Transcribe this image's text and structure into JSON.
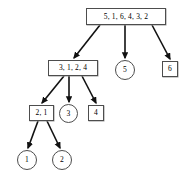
{
  "diagram": {
    "type": "recursion-tree",
    "width": 194,
    "height": 175,
    "stroke_color": "#4d4d4d",
    "edge_color": "#111111",
    "background": "#ffffff",
    "nodes": [
      {
        "id": "root",
        "label": "5, 1, 6, 4, 3, 2",
        "shape": "box",
        "x": 86,
        "y": 8,
        "w": 80,
        "h": 17,
        "font_size": 7.5
      },
      {
        "id": "n3124",
        "label": "3, 1, 2, 4",
        "shape": "box",
        "x": 48,
        "y": 60,
        "w": 50,
        "h": 16,
        "font_size": 7.5
      },
      {
        "id": "n5",
        "label": "5",
        "shape": "circle",
        "x": 115,
        "y": 60,
        "w": 20,
        "h": 20,
        "font_size": 7.5
      },
      {
        "id": "n6",
        "label": "6",
        "shape": "box",
        "x": 162,
        "y": 61,
        "w": 16,
        "h": 16,
        "font_size": 7.5
      },
      {
        "id": "n21",
        "label": "2, 1",
        "shape": "box",
        "x": 29,
        "y": 105,
        "w": 25,
        "h": 16,
        "font_size": 7.5
      },
      {
        "id": "n3",
        "label": "3",
        "shape": "circle",
        "x": 59,
        "y": 104,
        "w": 19,
        "h": 19,
        "font_size": 7.5
      },
      {
        "id": "n4",
        "label": "4",
        "shape": "box",
        "x": 88,
        "y": 105,
        "w": 16,
        "h": 16,
        "font_size": 7.5
      },
      {
        "id": "n1",
        "label": "1",
        "shape": "circle",
        "x": 17,
        "y": 150,
        "w": 20,
        "h": 20,
        "font_size": 7.5
      },
      {
        "id": "n2",
        "label": "2",
        "shape": "circle",
        "x": 52,
        "y": 150,
        "w": 20,
        "h": 20,
        "font_size": 7.5
      }
    ],
    "edges": [
      {
        "id": "e-root-3124",
        "from": "root",
        "to": "n3124",
        "x1": 100,
        "y1": 25,
        "x2": 74,
        "y2": 58
      },
      {
        "id": "e-root-5",
        "from": "root",
        "to": "n5",
        "x1": 125,
        "y1": 25,
        "x2": 125,
        "y2": 58
      },
      {
        "id": "e-root-6",
        "from": "root",
        "to": "n6",
        "x1": 152,
        "y1": 25,
        "x2": 170,
        "y2": 59
      },
      {
        "id": "e-3124-21",
        "from": "n3124",
        "to": "n21",
        "x1": 64,
        "y1": 76,
        "x2": 42,
        "y2": 103
      },
      {
        "id": "e-3124-3",
        "from": "n3124",
        "to": "n3",
        "x1": 69,
        "y1": 76,
        "x2": 69,
        "y2": 102
      },
      {
        "id": "e-3124-4",
        "from": "n3124",
        "to": "n4",
        "x1": 82,
        "y1": 76,
        "x2": 96,
        "y2": 103
      },
      {
        "id": "e-21-1",
        "from": "n21",
        "to": "n1",
        "x1": 38,
        "y1": 121,
        "x2": 28,
        "y2": 148
      },
      {
        "id": "e-21-2",
        "from": "n21",
        "to": "n2",
        "x1": 47,
        "y1": 121,
        "x2": 60,
        "y2": 148
      }
    ]
  }
}
